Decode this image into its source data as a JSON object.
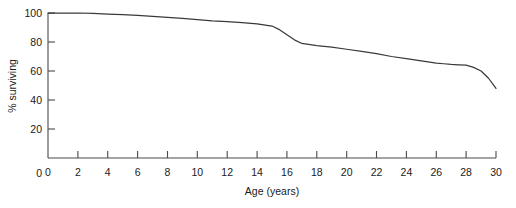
{
  "chart_data": {
    "type": "line",
    "title": "",
    "subtitle": "",
    "xlabel": "Age (years)",
    "ylabel": "% surviving",
    "xlim": [
      0,
      30
    ],
    "ylim": [
      0,
      100
    ],
    "grid": false,
    "legend": null,
    "line_color": "#3a3a3a",
    "axis_color": "#4a4a4a",
    "xticks": [
      0,
      2,
      4,
      6,
      8,
      10,
      12,
      14,
      16,
      18,
      20,
      22,
      24,
      26,
      28,
      30
    ],
    "xtick_labels": [
      "0",
      "2",
      "4",
      "6",
      "8",
      "10",
      "12",
      "14",
      "16",
      "18",
      "20",
      "22",
      "24",
      "26",
      "28",
      "30"
    ],
    "yticks": [
      0,
      20,
      40,
      60,
      80,
      100
    ],
    "ytick_labels": [
      "0",
      "20",
      "40",
      "60",
      "80",
      "100"
    ],
    "series": [
      {
        "name": "% surviving",
        "x": [
          0,
          1,
          2,
          3,
          4,
          5,
          6,
          7,
          8,
          9,
          10,
          11,
          12,
          13,
          14,
          15,
          15.5,
          16,
          16.5,
          17,
          18,
          19,
          20,
          21,
          22,
          23,
          24,
          25,
          26,
          26.5,
          27,
          27.5,
          28,
          28.5,
          29,
          29.5,
          30
        ],
        "y": [
          100,
          100,
          100,
          99.7,
          99.3,
          98.8,
          98.3,
          97.6,
          97,
          96.3,
          95.5,
          94.6,
          94,
          93.3,
          92.5,
          91,
          88.5,
          85,
          81.5,
          79,
          77.5,
          76.5,
          75,
          73.5,
          72,
          70,
          68.5,
          67,
          65.5,
          65,
          64.5,
          64.3,
          64,
          62.5,
          60,
          55,
          48
        ]
      }
    ]
  }
}
